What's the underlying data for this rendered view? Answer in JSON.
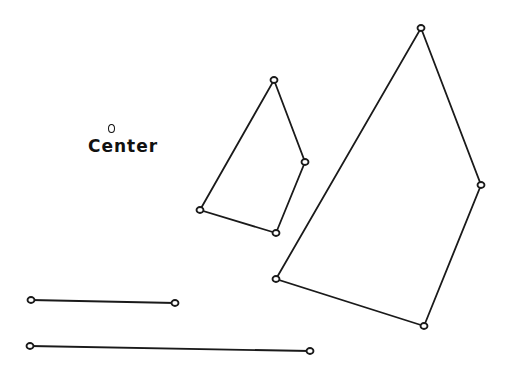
{
  "label": {
    "text": "Center",
    "marker": "small-circle"
  },
  "stroke_color": "#1a1a1a",
  "background": "#ffffff",
  "shapes": {
    "small_quad": [
      [
        274,
        80
      ],
      [
        305,
        162
      ],
      [
        276,
        233
      ],
      [
        200,
        210
      ]
    ],
    "large_quad": [
      [
        421,
        28
      ],
      [
        481,
        185
      ],
      [
        424,
        326
      ],
      [
        276,
        279
      ]
    ],
    "line_short": [
      [
        31,
        300
      ],
      [
        175,
        303
      ]
    ],
    "line_long": [
      [
        30,
        346
      ],
      [
        310,
        351
      ]
    ]
  }
}
